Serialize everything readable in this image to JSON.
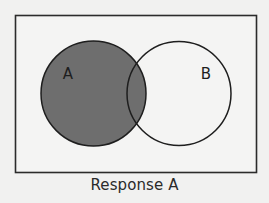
{
  "diagram": {
    "type": "venn",
    "caption": "Response A",
    "sets": [
      {
        "label": "A",
        "shaded": true
      },
      {
        "label": "B",
        "shaded": false
      }
    ],
    "shaded_region": "A",
    "colors": {
      "background": "#f1f1f0",
      "frame_stroke": "#2b2b2b",
      "shaded_fill": "#6e6e6e",
      "unshaded_fill": "#f4f4f3",
      "circle_stroke": "#1e1e1e"
    }
  }
}
